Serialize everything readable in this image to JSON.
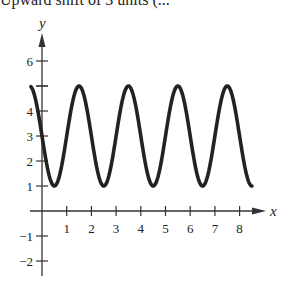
{
  "caption": "Upward shift of 3 units (...",
  "chart_data": {
    "type": "line",
    "title": "",
    "xlabel": "x",
    "ylabel": "y",
    "function": "y = 3 - 2 sin(pi x)",
    "xlim": [
      -0.5,
      8.6
    ],
    "ylim": [
      -2.4,
      7
    ],
    "grid": false,
    "x_ticks": [
      1,
      2,
      3,
      4,
      5,
      6,
      7,
      8
    ],
    "y_ticks": [
      -2,
      -1,
      1,
      2,
      3,
      4,
      5,
      6
    ],
    "y_tick_labels": [
      "−2",
      "−1",
      "1",
      "2",
      "3",
      "4",
      "",
      "6"
    ],
    "series": [
      {
        "name": "curve",
        "color": "#222222",
        "x": [
          -0.45,
          0,
          0.5,
          1,
          1.5,
          2,
          2.5,
          3,
          3.5,
          4,
          4.5,
          5,
          5.5,
          6,
          6.5,
          7,
          7.5,
          8,
          8.5
        ],
        "values": [
          4.98,
          3,
          1,
          3,
          5,
          3,
          1,
          3,
          5,
          3,
          1,
          3,
          5,
          3,
          1,
          3,
          5,
          3,
          1
        ]
      }
    ],
    "peaks_x": [
      1.5,
      3.5,
      5.5,
      7.5
    ],
    "minima_x": [
      0.5,
      2.5,
      4.5,
      6.5,
      8.5
    ],
    "amplitude": 2,
    "period": 2,
    "midline": 3
  },
  "axes": {
    "x_label": "x",
    "y_label": "y"
  }
}
